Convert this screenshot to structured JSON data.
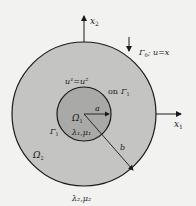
{
  "diagram": {
    "axes": {
      "x1": "x",
      "x1_sub": "1",
      "x2": "x",
      "x2_sub": "2"
    },
    "outer_region": {
      "name": "Ω",
      "sub": "2",
      "params": "λ₂,μ₂",
      "fill": "#c4c4c2"
    },
    "inner_region": {
      "name": "Ω",
      "sub": "1",
      "params": "λ₁,μ₁",
      "fill": "#a9a9a7"
    },
    "interface": {
      "condition": "u¹=u²",
      "on_label": "on",
      "gamma": "Γ",
      "gamma_sub": "1"
    },
    "outer_boundary": {
      "label": "Γ",
      "sub": "0",
      "condition": "; u=x"
    },
    "radii": {
      "inner": "a",
      "outer": "b"
    },
    "colors": {
      "background": "#f2f2f0",
      "stroke": "#1a1a1a"
    }
  }
}
